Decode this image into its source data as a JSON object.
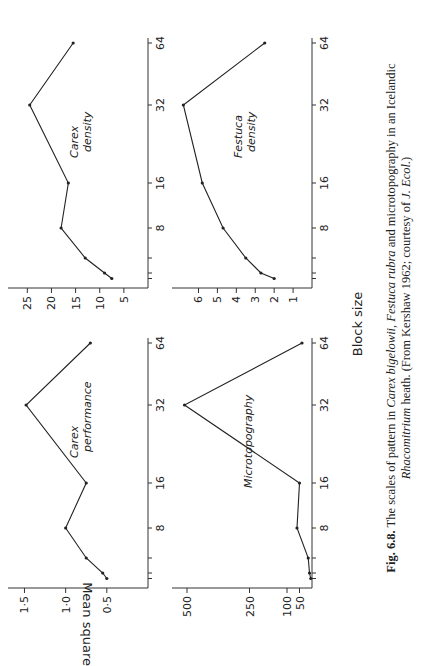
{
  "figure": {
    "xlabel": "Block size",
    "ylabel": "Mean square",
    "caption_label": "Fig. 6.8.",
    "caption_text_1": "The scales of pattern in",
    "caption_species_1": "Carex bigelowii,",
    "caption_species_2": "Festuca rubra",
    "caption_text_2": "and microtopography in an Icelandic",
    "caption_species_3": "Rhacomitrium",
    "caption_text_3": "heath. (From Kershaw 1962; courtesy of",
    "caption_journal": "J. Ecol.",
    "caption_text_4": ")"
  },
  "chart_data": [
    {
      "type": "line",
      "title": "Carex performance",
      "xlabel": "Block size",
      "ylabel": "Mean square",
      "x": [
        1,
        2,
        4,
        8,
        16,
        32,
        64
      ],
      "values": [
        0.5,
        0.55,
        0.75,
        1.0,
        0.75,
        1.48,
        0.7
      ],
      "xticks": [
        "8",
        "16",
        "32",
        "64"
      ],
      "yticks": [
        "0·5",
        "1·0",
        "1·5"
      ],
      "ylim": [
        0,
        1.7
      ]
    },
    {
      "type": "line",
      "title": "Microtopography",
      "xlabel": "Block size",
      "ylabel": "Mean square",
      "x": [
        1,
        2,
        4,
        8,
        16,
        32,
        64
      ],
      "values": [
        5,
        10,
        15,
        60,
        50,
        510,
        40
      ],
      "xticks": [
        "8",
        "16",
        "32",
        "64"
      ],
      "yticks": [
        "50",
        "100",
        "250",
        "500"
      ],
      "ylim": [
        0,
        560
      ]
    },
    {
      "type": "line",
      "title": "Carex density",
      "xlabel": "Block size",
      "ylabel": "Mean square",
      "x": [
        1,
        2,
        4,
        8,
        16,
        32,
        64
      ],
      "values": [
        7.5,
        9,
        13,
        18,
        16.5,
        24.5,
        15.5
      ],
      "xticks": [
        "8",
        "16",
        "32",
        "64"
      ],
      "yticks": [
        "5",
        "10",
        "15",
        "20",
        "25"
      ],
      "ylim": [
        0,
        29
      ]
    },
    {
      "type": "line",
      "title": "Festuca density",
      "xlabel": "Block size",
      "ylabel": "Mean square",
      "x": [
        1,
        2,
        4,
        8,
        16,
        32,
        64
      ],
      "values": [
        2,
        2.7,
        3.5,
        4.7,
        5.8,
        6.8,
        2.5
      ],
      "xticks": [
        "8",
        "16",
        "32",
        "64"
      ],
      "yticks": [
        "1",
        "2",
        "3",
        "4",
        "5",
        "6"
      ],
      "ylim": [
        0,
        7.4
      ]
    }
  ],
  "labels": {
    "p1_l1": "Carex",
    "p1_l2": "performance",
    "p2_l1": "Microtopography",
    "p3_l1": "Carex",
    "p3_l2": "density",
    "p4_l1": "Festuca",
    "p4_l2": "density"
  }
}
